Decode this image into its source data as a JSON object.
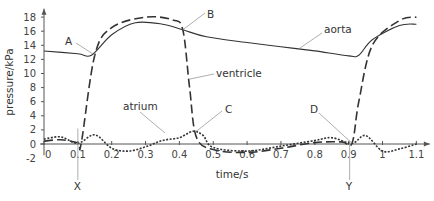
{
  "chart_data": {
    "type": "line",
    "title": "",
    "xlabel": "time/s",
    "ylabel": "pressure/kPa",
    "xlim": [
      0,
      1.13
    ],
    "ylim": [
      -2,
      19
    ],
    "xticks": [
      "0",
      "0.1",
      "0.2",
      "0.3",
      "0.4",
      "0.5",
      "0.6",
      "0.7",
      "0.8",
      "0.9",
      "1",
      "1.1"
    ],
    "yticks": [
      "-2",
      "0",
      "2",
      "4",
      "6",
      "8",
      "10",
      "12",
      "14",
      "16",
      "18"
    ],
    "grid": false,
    "legend": "inline labels",
    "series": [
      {
        "name": "aorta",
        "style": "solid",
        "x": [
          0,
          0.1,
          0.14,
          0.2,
          0.27,
          0.35,
          0.41,
          0.48,
          0.6,
          0.7,
          0.8,
          0.9,
          0.93,
          0.97,
          1.05,
          1.1
        ],
        "values": [
          13.2,
          12.8,
          12.6,
          15.5,
          17.2,
          17.0,
          16.2,
          15.2,
          14.4,
          13.8,
          13.2,
          12.5,
          12.6,
          14.8,
          16.8,
          17.0
        ]
      },
      {
        "name": "ventricle",
        "style": "dashed",
        "x": [
          0,
          0.05,
          0.1,
          0.11,
          0.15,
          0.2,
          0.3,
          0.38,
          0.41,
          0.43,
          0.45,
          0.5,
          0.6,
          0.7,
          0.8,
          0.88,
          0.91,
          0.93,
          0.97,
          1.05,
          1.1
        ],
        "values": [
          0.4,
          0.6,
          0.2,
          0.1,
          12.6,
          16.5,
          18.0,
          17.6,
          16.2,
          8.0,
          1.0,
          -0.8,
          -1.2,
          -0.6,
          0.2,
          0.3,
          0.1,
          6.0,
          14.0,
          17.5,
          18.0
        ]
      },
      {
        "name": "atrium",
        "style": "dotted",
        "x": [
          0,
          0.05,
          0.1,
          0.15,
          0.2,
          0.25,
          0.3,
          0.35,
          0.4,
          0.44,
          0.47,
          0.5,
          0.6,
          0.7,
          0.8,
          0.85,
          0.91,
          0.95,
          1.0,
          1.05,
          1.1
        ],
        "values": [
          0.7,
          1.0,
          0.1,
          1.3,
          -0.6,
          -1.0,
          -0.4,
          0.5,
          0.9,
          1.8,
          1.2,
          -0.5,
          -1.0,
          -0.3,
          0.5,
          0.9,
          0.1,
          1.2,
          -1.0,
          -0.7,
          0.0
        ]
      }
    ],
    "annotations": [
      {
        "label": "A",
        "t": 0.15,
        "p": 12.6,
        "desc": "aortic valve opens"
      },
      {
        "label": "B",
        "t": 0.41,
        "p": 16.2,
        "desc": "aortic valve closes"
      },
      {
        "label": "C",
        "t": 0.45,
        "p": 1.8,
        "desc": "AV valve opens"
      },
      {
        "label": "D",
        "t": 0.91,
        "p": 0.1,
        "desc": "AV valve closes"
      },
      {
        "label": "X",
        "t": 0.1,
        "desc": "vertical marker"
      },
      {
        "label": "Y",
        "t": 0.9,
        "desc": "vertical marker"
      }
    ],
    "curve_labels": [
      "aorta",
      "ventricle",
      "atrium"
    ]
  }
}
